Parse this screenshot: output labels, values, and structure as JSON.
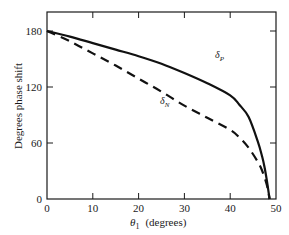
{
  "chart_data": {
    "type": "line",
    "title": "",
    "xlabel": "θ1 (degrees)",
    "xlabel_symbol": "θ",
    "xlabel_sub": "1",
    "xlabel_unit": "(degrees)",
    "ylabel": "Degrees phase shift",
    "xlim": [
      0,
      50
    ],
    "ylim": [
      0,
      200
    ],
    "xticks": [
      0,
      10,
      20,
      30,
      40,
      50
    ],
    "yticks": [
      0,
      60,
      120,
      180
    ],
    "grid": false,
    "legend": "inline labels",
    "series": [
      {
        "name": "δP",
        "symbol": "δ",
        "sub": "P",
        "style": "solid",
        "x": [
          0,
          5,
          10,
          15,
          20,
          25,
          30,
          35,
          40,
          42,
          44,
          46,
          47,
          47.5,
          48,
          48.3,
          48.6
        ],
        "values": [
          180,
          174,
          167,
          160,
          153,
          145,
          135,
          124,
          111,
          101,
          88,
          62,
          45,
          34,
          20,
          10,
          0
        ]
      },
      {
        "name": "δN",
        "symbol": "δ",
        "sub": "N",
        "style": "dashed",
        "x": [
          0,
          5,
          10,
          15,
          20,
          25,
          30,
          35,
          40,
          42,
          44,
          46,
          47,
          48,
          48.6
        ],
        "values": [
          180,
          169,
          156,
          143,
          129,
          115,
          100,
          87,
          74,
          66,
          55,
          40,
          30,
          15,
          0
        ]
      }
    ]
  }
}
